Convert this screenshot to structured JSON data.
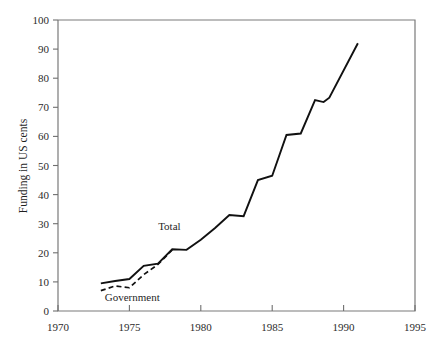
{
  "chart_data": {
    "type": "line",
    "title": "",
    "xlabel": "",
    "ylabel": "Funding in US cents",
    "xlim": [
      1970,
      1995
    ],
    "ylim": [
      0,
      100
    ],
    "xticks": [
      1970,
      1975,
      1980,
      1985,
      1990,
      1995
    ],
    "yticks": [
      0,
      10,
      20,
      30,
      40,
      50,
      60,
      70,
      80,
      90,
      100
    ],
    "xtick_labels": [
      "1970",
      "1975",
      "1980",
      "1985",
      "1990",
      "1995"
    ],
    "ytick_labels": [
      "0",
      "10",
      "20",
      "30",
      "40",
      "50",
      "60",
      "70",
      "80",
      "90",
      "100"
    ],
    "grid": false,
    "legend_position": "inline-annotations",
    "series": [
      {
        "name": "Total",
        "style": "solid",
        "color": "#111111",
        "x": [
          1973,
          1974,
          1975,
          1976,
          1977,
          1978,
          1979,
          1980,
          1981,
          1982,
          1983,
          1984,
          1985,
          1986,
          1987,
          1988,
          1988.6,
          1989,
          1991
        ],
        "values": [
          9.5,
          10.3,
          11.0,
          15.5,
          16.3,
          21.2,
          21.0,
          24.5,
          28.5,
          33.0,
          32.6,
          45.0,
          46.5,
          60.5,
          61.0,
          72.5,
          71.8,
          73.3,
          92.0
        ]
      },
      {
        "name": "Government",
        "style": "dashed",
        "color": "#111111",
        "x": [
          1973,
          1974,
          1975,
          1976,
          1977,
          1978
        ],
        "values": [
          7.0,
          8.6,
          8.0,
          12.5,
          16.0,
          21.0
        ]
      }
    ],
    "annotations": [
      {
        "text": "Total",
        "x": 1977.8,
        "y": 28.0
      },
      {
        "text": "Government",
        "x": 1975.2,
        "y": 3.5
      }
    ]
  },
  "axes": {
    "y_axis_title": "Funding in US cents"
  }
}
